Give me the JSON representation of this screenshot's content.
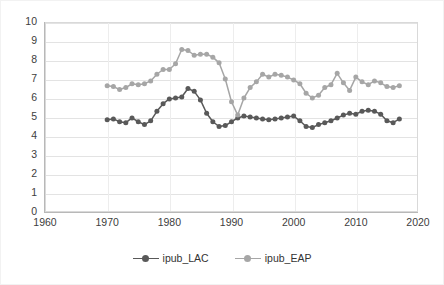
{
  "chart_data": {
    "type": "line",
    "title": "",
    "xlabel": "",
    "ylabel": "",
    "xlim": [
      1960,
      2020
    ],
    "ylim": [
      0,
      10
    ],
    "xticks": [
      1960,
      1970,
      1980,
      1990,
      2000,
      2010,
      2020
    ],
    "yticks": [
      0,
      1,
      2,
      3,
      4,
      5,
      6,
      7,
      8,
      9,
      10
    ],
    "grid": "horizontal-and-vertical",
    "legend_position": "bottom-center",
    "x": [
      1970,
      1971,
      1972,
      1973,
      1974,
      1975,
      1976,
      1977,
      1978,
      1979,
      1980,
      1981,
      1982,
      1983,
      1984,
      1985,
      1986,
      1987,
      1988,
      1989,
      1990,
      1991,
      1992,
      1993,
      1994,
      1995,
      1996,
      1997,
      1998,
      1999,
      2000,
      2001,
      2002,
      2003,
      2004,
      2005,
      2006,
      2007,
      2008,
      2009,
      2010,
      2011,
      2012,
      2013,
      2014,
      2015,
      2016,
      2017
    ],
    "series": [
      {
        "name": "ipub_LAC",
        "color": "#595959",
        "values": [
          4.85,
          4.9,
          4.75,
          4.7,
          4.95,
          4.75,
          4.6,
          4.8,
          5.3,
          5.7,
          5.95,
          6.0,
          6.05,
          6.5,
          6.35,
          5.9,
          5.2,
          4.75,
          4.5,
          4.55,
          4.75,
          4.95,
          5.05,
          5.0,
          4.95,
          4.9,
          4.85,
          4.9,
          4.95,
          5.0,
          5.05,
          4.8,
          4.5,
          4.45,
          4.6,
          4.7,
          4.8,
          4.95,
          5.1,
          5.2,
          5.15,
          5.3,
          5.35,
          5.3,
          5.15,
          4.8,
          4.7,
          4.9
        ]
      },
      {
        "name": "ipub_EAP",
        "color": "#a6a6a6",
        "values": [
          6.65,
          6.6,
          6.45,
          6.55,
          6.75,
          6.7,
          6.75,
          6.9,
          7.25,
          7.5,
          7.5,
          7.8,
          8.55,
          8.5,
          8.25,
          8.3,
          8.3,
          8.15,
          7.85,
          7.0,
          5.8,
          5.1,
          6.0,
          6.55,
          6.85,
          7.25,
          7.1,
          7.25,
          7.2,
          7.1,
          6.95,
          6.75,
          6.25,
          6.0,
          6.15,
          6.55,
          6.7,
          7.3,
          6.8,
          6.4,
          7.1,
          6.85,
          6.7,
          6.9,
          6.8,
          6.6,
          6.55,
          6.65
        ]
      }
    ],
    "legend": [
      {
        "label": "ipub_LAC",
        "color": "#595959"
      },
      {
        "label": "ipub_EAP",
        "color": "#a6a6a6"
      }
    ]
  }
}
